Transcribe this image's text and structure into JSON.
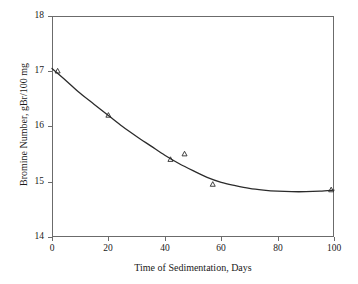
{
  "chart_data": {
    "type": "scatter",
    "title": "",
    "xlabel": "Time of Sedimentation, Days",
    "ylabel": "Bromine Number, gBr/100 mg",
    "xlim": [
      0,
      100
    ],
    "ylim": [
      14,
      18
    ],
    "xticks": [
      0,
      20,
      40,
      60,
      80,
      100
    ],
    "yticks": [
      14,
      15,
      16,
      17,
      18
    ],
    "xtick_labels": [
      "0",
      "20",
      "40",
      "60",
      "80",
      "100"
    ],
    "ytick_labels": [
      "14",
      "15",
      "16",
      "17",
      "18"
    ],
    "grid": false,
    "legend": null,
    "marker": "open-triangle",
    "marker_color": "#2b2b2b",
    "line_color": "#2b2b2b",
    "frame_color": "#6b6b6b",
    "series": [
      {
        "name": "Bromine Number measurements",
        "kind": "points",
        "marker": "open-triangle",
        "x": [
          2,
          20,
          42,
          47,
          57,
          99
        ],
        "y": [
          17.0,
          16.2,
          15.4,
          15.5,
          14.95,
          14.85
        ]
      },
      {
        "name": "Fitted trend curve",
        "kind": "line",
        "x": [
          0,
          5,
          10,
          15,
          20,
          25,
          30,
          35,
          40,
          45,
          50,
          55,
          60,
          65,
          70,
          75,
          80,
          85,
          90,
          95,
          100
        ],
        "y": [
          17.05,
          16.83,
          16.6,
          16.4,
          16.2,
          16.0,
          15.82,
          15.65,
          15.48,
          15.33,
          15.2,
          15.08,
          14.99,
          14.93,
          14.88,
          14.85,
          14.83,
          14.82,
          14.82,
          14.83,
          14.85
        ]
      }
    ]
  }
}
